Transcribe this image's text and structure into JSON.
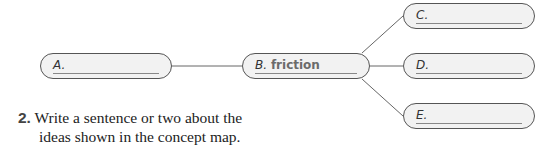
{
  "concept_map": {
    "nodes": {
      "A": {
        "prefix": "A.",
        "text": ""
      },
      "B": {
        "prefix": "B.",
        "text": "friction"
      },
      "C": {
        "prefix": "C.",
        "text": ""
      },
      "D": {
        "prefix": "D.",
        "text": ""
      },
      "E": {
        "prefix": "E.",
        "text": ""
      }
    },
    "colors": {
      "border": "#555555",
      "fill": "#f2f2f2",
      "line": "#666666"
    }
  },
  "question": {
    "number": "2.",
    "line1": "Write a sentence or two about the",
    "line2": "ideas shown in the concept map."
  }
}
